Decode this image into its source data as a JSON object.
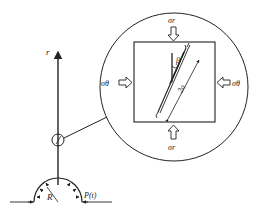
{
  "diagram": {
    "axis_label": "r",
    "radius_label": "R",
    "pressure_label": "P(t)",
    "zoom_view": {
      "top_stress": "σr",
      "bottom_stress": "σr",
      "left_stress": "σθ",
      "right_stress": "σθ",
      "angle_label": "β",
      "crack_length_label": "2a"
    },
    "colors": {
      "stroke": "#222222",
      "background": "#ffffff"
    }
  }
}
